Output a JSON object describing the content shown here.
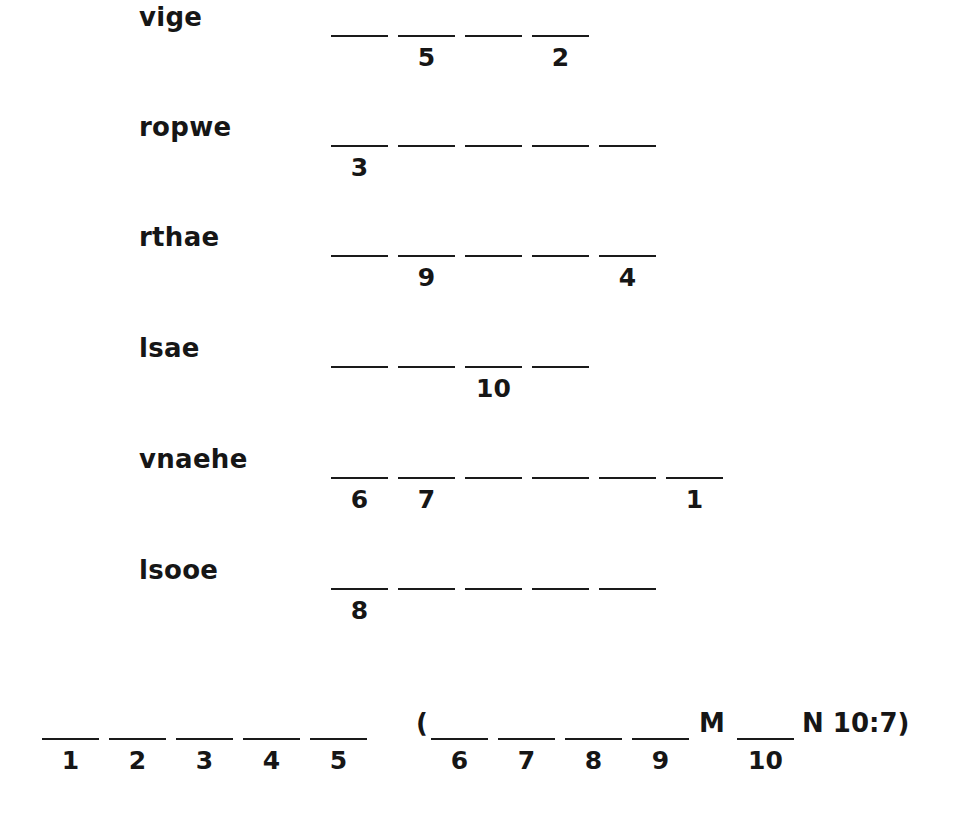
{
  "puzzle": {
    "rows": [
      {
        "scrambled": "vige",
        "length": 4,
        "numbers": [
          "",
          "5",
          "",
          "2"
        ]
      },
      {
        "scrambled": "ropwe",
        "length": 5,
        "numbers": [
          "3",
          "",
          "",
          "",
          ""
        ]
      },
      {
        "scrambled": "rthae",
        "length": 5,
        "numbers": [
          "",
          "9",
          "",
          "",
          "4"
        ]
      },
      {
        "scrambled": "lsae",
        "length": 4,
        "numbers": [
          "",
          "",
          "10",
          ""
        ]
      },
      {
        "scrambled": "vnaehe",
        "length": 6,
        "numbers": [
          "6",
          "7",
          "",
          "",
          "",
          "1"
        ]
      },
      {
        "scrambled": "lsooe",
        "length": 5,
        "numbers": [
          "8",
          "",
          "",
          "",
          ""
        ]
      }
    ],
    "answer": {
      "first_group_numbers": [
        "1",
        "2",
        "3",
        "4",
        "5"
      ],
      "open_paren": "(",
      "second_group_numbers": [
        "6",
        "7",
        "8",
        "9"
      ],
      "letter_m": "M",
      "blank_after_m_number": "10",
      "suffix": "N 10:7)"
    }
  }
}
